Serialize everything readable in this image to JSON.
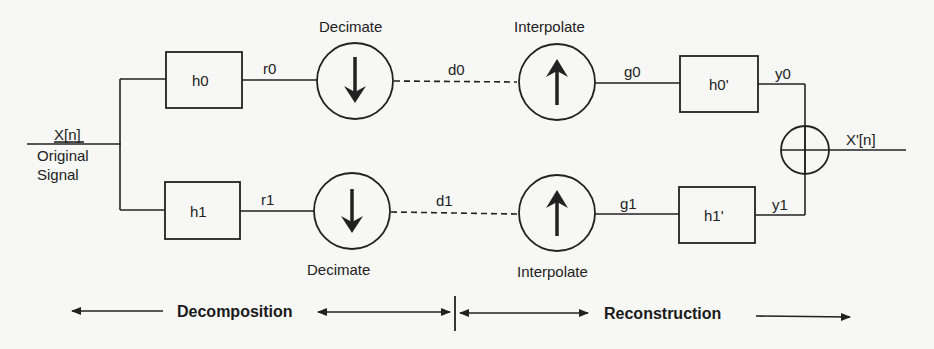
{
  "input": {
    "label": "X[n]",
    "caption_line1": "Original",
    "caption_line2": "Signal"
  },
  "output": {
    "label": "X'[n]"
  },
  "analysis_filters": [
    {
      "name": "h0",
      "output_signal": "r0"
    },
    {
      "name": "h1",
      "output_signal": "r1"
    }
  ],
  "decimators": [
    {
      "label": "Decimate",
      "output_signal": "d0",
      "arrow": "down-arrow"
    },
    {
      "label": "Decimate",
      "output_signal": "d1",
      "arrow": "down-arrow"
    }
  ],
  "interpolators": [
    {
      "label": "Interpolate",
      "output_signal": "g0",
      "arrow": "up-arrow"
    },
    {
      "label": "Interpolate",
      "output_signal": "g1",
      "arrow": "up-arrow"
    }
  ],
  "synthesis_filters": [
    {
      "name": "h0'",
      "output_signal": "y0"
    },
    {
      "name": "h1'",
      "output_signal": "y1"
    }
  ],
  "summer": {
    "symbol": "circled-plus"
  },
  "stages": {
    "decomposition": "Decomposition",
    "reconstruction": "Reconstruction"
  },
  "colors": {
    "stroke": "#222222",
    "background": "#f7f7f5"
  }
}
